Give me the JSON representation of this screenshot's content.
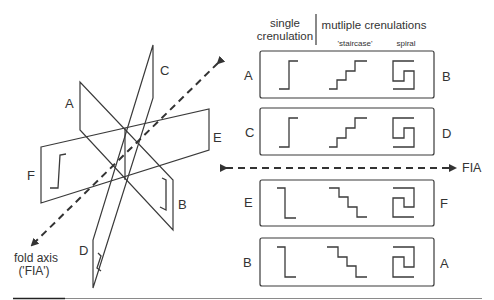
{
  "figure": {
    "left_panel": {
      "plane_labels": {
        "A": "A",
        "B": "B",
        "C": "C",
        "D": "D",
        "E": "E",
        "F": "F"
      },
      "fold_axis_label_line1": "fold axis",
      "fold_axis_label_line2": "('FIA')"
    },
    "right_panel": {
      "header": {
        "single_line1": "single",
        "single_line2": "crenulation",
        "multiple": "mutliple crenulations",
        "staircase": "'staircase'",
        "spiral": "spiral"
      },
      "rows": [
        {
          "left": "A",
          "right": "B"
        },
        {
          "left": "C",
          "right": "D"
        },
        {
          "left": "E",
          "right": "F"
        },
        {
          "left": "B",
          "right": "A"
        }
      ],
      "fia_label": "FIA"
    },
    "colors": {
      "line": "#3a3a3a",
      "background": "#ffffff"
    }
  }
}
